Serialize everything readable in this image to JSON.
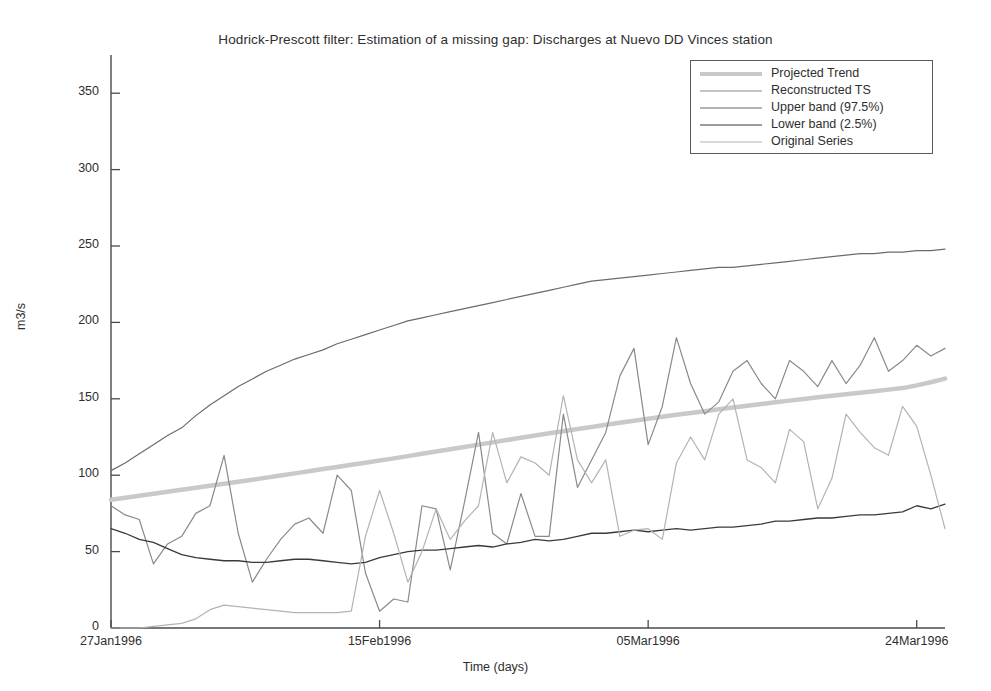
{
  "chart_data": {
    "type": "line",
    "title": "Hodrick-Prescott filter: Estimation of a missing gap: Discharges at Nuevo DD Vinces station",
    "xlabel": "Time (days)",
    "ylabel": "m3/s",
    "grid": false,
    "legend_position": "top-right",
    "xlim": [
      "27Jan1996",
      "27Mar1996"
    ],
    "ylim": [
      0,
      375
    ],
    "yticks": [
      0,
      50,
      100,
      150,
      200,
      250,
      300,
      350
    ],
    "xticks": [
      "27Jan1996",
      "15Feb1996",
      "05Mar1996",
      "24Mar1996"
    ],
    "xtick_days": [
      0,
      19,
      38,
      57
    ],
    "x_days": [
      0,
      1,
      2,
      3,
      4,
      5,
      6,
      7,
      8,
      9,
      10,
      11,
      12,
      13,
      14,
      15,
      16,
      17,
      18,
      19,
      20,
      21,
      22,
      23,
      24,
      25,
      26,
      27,
      28,
      29,
      30,
      31,
      32,
      33,
      34,
      35,
      36,
      37,
      38,
      39,
      40,
      41,
      42,
      43,
      44,
      45,
      46,
      47,
      48,
      49,
      50,
      51,
      52,
      53,
      54,
      55,
      56,
      57,
      58,
      59
    ],
    "series": [
      {
        "name": "Projected Trend",
        "color": "#c9c9c9",
        "width": 4.5,
        "values": [
          84,
          85.3,
          86.6,
          87.9,
          89.2,
          90.5,
          91.8,
          93.1,
          94.4,
          95.7,
          97,
          98.4,
          99.8,
          101.2,
          102.6,
          104,
          105.4,
          106.8,
          108.2,
          109.6,
          111,
          112.5,
          114,
          115.5,
          117,
          118.5,
          120,
          121.5,
          123,
          124.5,
          126,
          127.4,
          128.8,
          130.2,
          131.6,
          133,
          134.3,
          135.6,
          136.9,
          138.2,
          139.5,
          140.7,
          141.9,
          143.1,
          144.3,
          145.5,
          146.6,
          147.7,
          148.8,
          149.9,
          151,
          152,
          153,
          154,
          155,
          156,
          157,
          158.8,
          160.8,
          163.2
        ]
      },
      {
        "name": "Reconstructed TS",
        "color": "#8a8a8a",
        "width": 1.2,
        "values": [
          80,
          74,
          71,
          42,
          55,
          60,
          75,
          80,
          113,
          62,
          30,
          45,
          58,
          68,
          72,
          62,
          100,
          90,
          36,
          11,
          19,
          17,
          80,
          78,
          38,
          82,
          128,
          62,
          55,
          88,
          60,
          60,
          140,
          92,
          110,
          128,
          165,
          183,
          120,
          145,
          190,
          160,
          140,
          148,
          168,
          175,
          160,
          150,
          175,
          168,
          158,
          175,
          160,
          172,
          190,
          168,
          175,
          185,
          178,
          183
        ]
      },
      {
        "name": "Upper band (97.5%)",
        "color": "#6b6b6b",
        "width": 1.2,
        "values": [
          103,
          108,
          114,
          120,
          126,
          131,
          139,
          146,
          152,
          158,
          163,
          168,
          172,
          176,
          179,
          182,
          186,
          189,
          192,
          195,
          198,
          201,
          203,
          205,
          207,
          209,
          211,
          213,
          215,
          217,
          219,
          221,
          223,
          225,
          227,
          228,
          229,
          230,
          231,
          232,
          233,
          234,
          235,
          236,
          236,
          237,
          238,
          239,
          240,
          241,
          242,
          243,
          244,
          245,
          245,
          246,
          246,
          247,
          247,
          248
        ]
      },
      {
        "name": "Lower band (2.5%)",
        "color": "#3a3a3a",
        "width": 1.3,
        "values": [
          65,
          62,
          58,
          56,
          52,
          48,
          46,
          45,
          44,
          44,
          43,
          43,
          44,
          45,
          45,
          44,
          43,
          42,
          43,
          46,
          48,
          50,
          51,
          51,
          52,
          53,
          54,
          53,
          55,
          56,
          58,
          57,
          58,
          60,
          62,
          62,
          63,
          64,
          63,
          64,
          65,
          64,
          65,
          66,
          66,
          67,
          68,
          70,
          70,
          71,
          72,
          72,
          73,
          74,
          74,
          75,
          76,
          80,
          78,
          81
        ]
      },
      {
        "name": "Original Series",
        "color": "#b3b3b3",
        "width": 1.2,
        "values": [
          0,
          0,
          0,
          1,
          2,
          3,
          6,
          12,
          15,
          14,
          13,
          12,
          11,
          10,
          10,
          10,
          10,
          11,
          60,
          90,
          62,
          30,
          50,
          78,
          58,
          70,
          80,
          128,
          95,
          112,
          108,
          100,
          152,
          110,
          95,
          110,
          60,
          64,
          65,
          58,
          108,
          125,
          110,
          140,
          150,
          110,
          105,
          95,
          130,
          122,
          78,
          98,
          140,
          128,
          118,
          113,
          145,
          132,
          100,
          65
        ]
      }
    ]
  }
}
